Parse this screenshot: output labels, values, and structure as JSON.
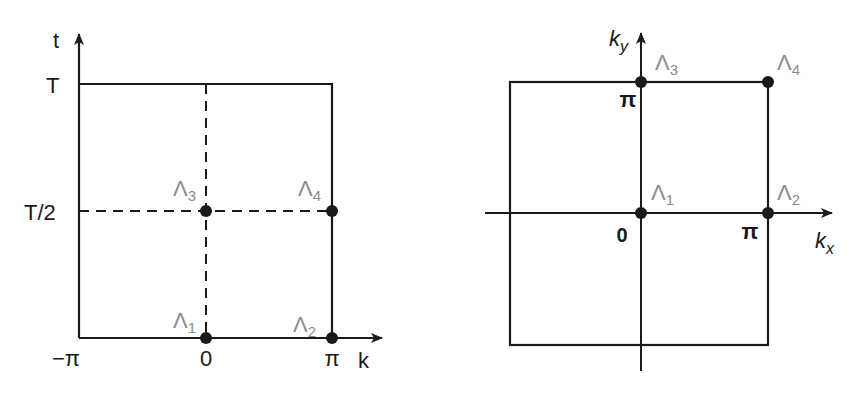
{
  "left_diagram": {
    "title": "1D time-periodic Brillouin zone",
    "axes": {
      "x_label": "k",
      "y_label": "t",
      "x_ticks": [
        "−π",
        "0",
        "π"
      ],
      "y_ticks": [
        "T",
        "T/2"
      ]
    },
    "points": [
      {
        "name": "Λ",
        "sub": "1",
        "k": "0",
        "t": "0"
      },
      {
        "name": "Λ",
        "sub": "2",
        "k": "π",
        "t": "0"
      },
      {
        "name": "Λ",
        "sub": "3",
        "k": "0",
        "t": "T/2"
      },
      {
        "name": "Λ",
        "sub": "4",
        "k": "π",
        "t": "T/2"
      }
    ]
  },
  "right_diagram": {
    "title": "2D Brillouin zone",
    "axes": {
      "x_label": "k",
      "x_sub": "x",
      "y_label": "k",
      "y_sub": "y",
      "origin": "0",
      "x_tick": "π",
      "y_tick": "π"
    },
    "points": [
      {
        "name": "Λ",
        "sub": "1",
        "kx": "0",
        "ky": "0"
      },
      {
        "name": "Λ",
        "sub": "2",
        "kx": "π",
        "ky": "0"
      },
      {
        "name": "Λ",
        "sub": "3",
        "kx": "0",
        "ky": "π"
      },
      {
        "name": "Λ",
        "sub": "4",
        "kx": "π",
        "ky": "π"
      }
    ]
  },
  "colors": {
    "line": "#1a1a1a",
    "label_gray": "#8c8c8c"
  }
}
